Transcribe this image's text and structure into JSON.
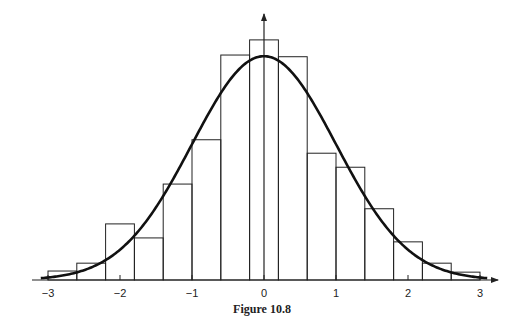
{
  "caption": "Figure 10.8",
  "colors": {
    "ink": "#222222",
    "background": "#ffffff"
  },
  "chart_data": {
    "type": "bar",
    "title": "Figure 10.8",
    "xlabel": "",
    "ylabel": "",
    "xlim": [
      -3.2,
      3.2
    ],
    "ylim": [
      0,
      0.45
    ],
    "grid": false,
    "legend": null,
    "x_ticks": [
      -3,
      -2,
      -1,
      0,
      1,
      2,
      3
    ],
    "x_tick_labels": [
      "−3",
      "−2",
      "−1",
      "0",
      "1",
      "2",
      "3"
    ],
    "bin_edges": [
      -3.0,
      -2.6,
      -2.2,
      -1.8,
      -1.4,
      -1.0,
      -0.6,
      -0.2,
      0.2,
      0.6,
      1.0,
      1.4,
      1.8,
      2.2,
      2.6,
      3.0
    ],
    "categories": [
      "[-3.0,-2.6)",
      "[-2.6,-2.2)",
      "[-2.2,-1.8)",
      "[-1.8,-1.4)",
      "[-1.4,-1.0)",
      "[-1.0,-0.6)",
      "[-0.6,-0.2)",
      "[-0.2,0.2)",
      "[0.2,0.6)",
      "[0.6,1.0)",
      "[1.0,1.4)",
      "[1.4,1.8)",
      "[1.8,2.2)",
      "[2.2,2.6)",
      "[2.6,3.0)"
    ],
    "series": [
      {
        "name": "histogram (density)",
        "type": "bar",
        "values": [
          0.016,
          0.03,
          0.1,
          0.075,
          0.171,
          0.25,
          0.401,
          0.428,
          0.398,
          0.226,
          0.201,
          0.127,
          0.068,
          0.03,
          0.014
        ]
      },
      {
        "name": "standard normal density",
        "type": "line",
        "formula": "exp(-x^2/2)/sqrt(2*pi)",
        "x_range": [
          -3.1,
          3.1
        ],
        "peak": 0.399
      }
    ]
  }
}
